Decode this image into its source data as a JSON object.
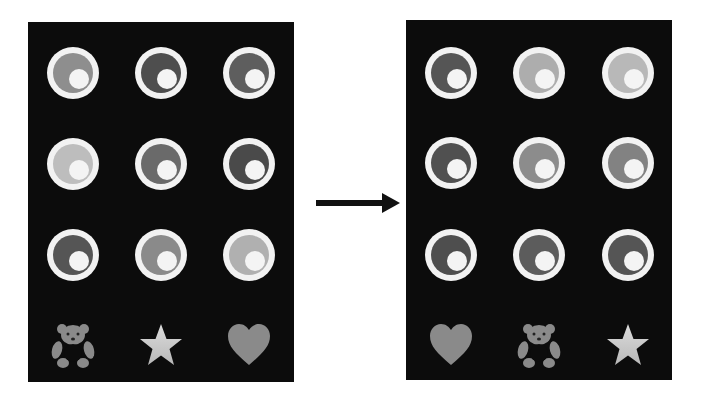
{
  "figure": {
    "colors": {
      "panel_bg": "#0c0c0c",
      "ring_outer": "#f2f2f2",
      "ring_core": "#f4f4f4",
      "shade_dark": "#555555",
      "shade_medium": "#808080",
      "shade_light": "#a8a8a8",
      "shade_lightest": "#c4c4c4",
      "icon_gray": "#8a8a8a",
      "star_light": "#dcdcdc",
      "arrow": "#111111"
    },
    "left_panel": {
      "rings": [
        [
          "#8e8e8e",
          "#4e4e4e",
          "#5e5e5e"
        ],
        [
          "#bdbdbd",
          "#6a6a6a",
          "#4a4a4a"
        ],
        [
          "#555555",
          "#8a8a8a",
          "#b0b0b0"
        ]
      ],
      "icons": [
        "teddy-bear",
        "star",
        "heart"
      ]
    },
    "right_panel": {
      "rings": [
        [
          "#555555",
          "#adadad",
          "#b8b8b8"
        ],
        [
          "#505050",
          "#8c8c8c",
          "#828282"
        ],
        [
          "#4e4e4e",
          "#5c5c5c",
          "#555555"
        ]
      ],
      "icons": [
        "heart",
        "teddy-bear",
        "star"
      ]
    },
    "arrow": {
      "direction": "right"
    }
  }
}
